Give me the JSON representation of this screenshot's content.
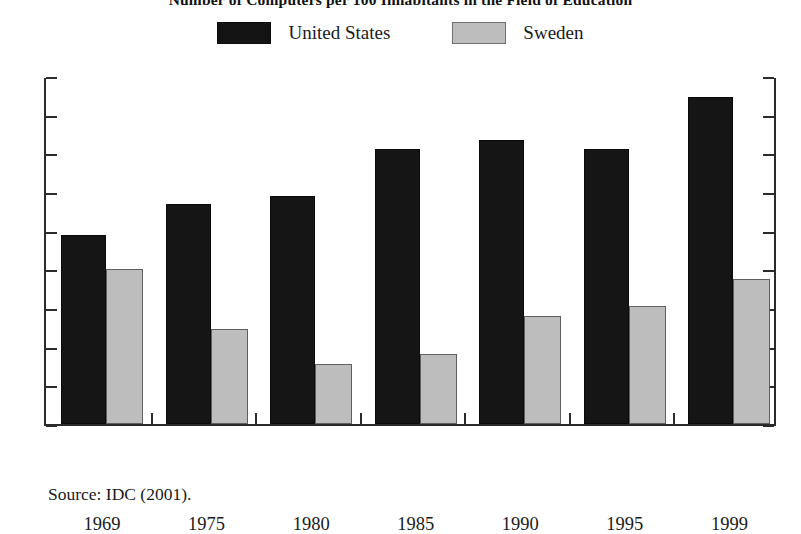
{
  "chart_data": {
    "type": "bar",
    "title": "Number of Computers per 100 Inhabitants in the Field of Education",
    "subtitle": "",
    "xlabel": "",
    "ylabel": "",
    "categories": [
      "1969",
      "1975",
      "1980",
      "1985",
      "1990",
      "1995",
      "1999"
    ],
    "series": [
      {
        "name": "United States",
        "color": "#151515",
        "values": [
          0.49,
          0.57,
          0.59,
          0.71,
          0.735,
          0.71,
          0.845
        ]
      },
      {
        "name": "Sweden",
        "color": "#bdbdbd",
        "values": [
          0.4,
          0.245,
          0.155,
          0.18,
          0.28,
          0.305,
          0.375
        ]
      }
    ],
    "ylim": [
      0,
      0.9
    ],
    "ytick_values": [
      0,
      0.1,
      0.2,
      0.3,
      0.4,
      0.5,
      0.6,
      0.7,
      0.8,
      0.9
    ],
    "ytick_labels": [
      "0",
      "0.1",
      "0.2",
      "0.3",
      "0.4",
      "0.5",
      "0.6",
      "0.7",
      "0.8",
      "0.9"
    ],
    "grid": false,
    "legend_position": "top-center",
    "source_note": "Source: IDC (2001)."
  },
  "legend": {
    "items": [
      {
        "label": "United States",
        "swatch": "black-swatch"
      },
      {
        "label": "Sweden",
        "swatch": "gray-swatch"
      }
    ]
  },
  "footer": {
    "source": "Source: IDC (2001)."
  },
  "colors": {
    "series_us": "#151515",
    "series_sweden": "#bdbdbd",
    "axis": "#2b2b2b",
    "background": "#ffffff",
    "text": "#1a1a1a"
  }
}
